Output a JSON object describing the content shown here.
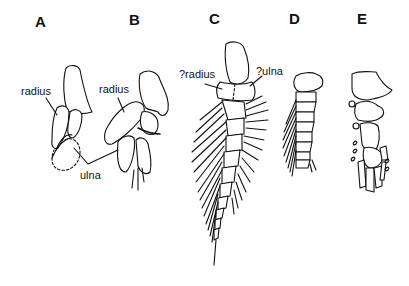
{
  "figure": {
    "panels": [
      {
        "id": "A",
        "label": "A"
      },
      {
        "id": "B",
        "label": "B"
      },
      {
        "id": "C",
        "label": "C"
      },
      {
        "id": "D",
        "label": "D"
      },
      {
        "id": "E",
        "label": "E"
      }
    ],
    "annotations": {
      "a_radius": "radius",
      "b_radius": "radius",
      "shared_ulna": "ulna",
      "c_radius": "?radius",
      "c_ulna": "?ulna"
    },
    "colors": {
      "line": "#111111",
      "background": "#ffffff"
    }
  }
}
